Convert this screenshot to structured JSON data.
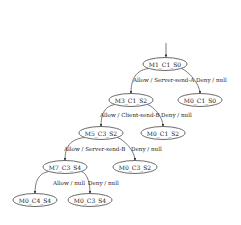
{
  "diagram": {
    "type": "state-machine-tree",
    "start": {
      "x": 166,
      "y1": 43,
      "y2": 57
    },
    "nodes": [
      {
        "id": "n0",
        "label": "M1_C1_S0",
        "x": 165,
        "y": 64
      },
      {
        "id": "n1",
        "label": "M3_C1_S2",
        "x": 131,
        "y": 100
      },
      {
        "id": "n2",
        "label": "M0_C1_S0",
        "x": 200,
        "y": 100
      },
      {
        "id": "n3",
        "label": "M5_C3_S2",
        "x": 101,
        "y": 133
      },
      {
        "id": "n4",
        "label": "M0_C1_S2",
        "x": 163,
        "y": 133
      },
      {
        "id": "n5",
        "label": "M7_C3_S4",
        "x": 65,
        "y": 167
      },
      {
        "id": "n6",
        "label": "M0_C3_S2",
        "x": 135,
        "y": 167
      },
      {
        "id": "n7",
        "label": "M0_C4_S4",
        "x": 35,
        "y": 200
      },
      {
        "id": "n8",
        "label": "M0_C3_S4",
        "x": 90,
        "y": 200
      }
    ],
    "edges": [
      {
        "from": "n0",
        "to": "n1",
        "label": "Allow / Server-send-A",
        "lx": 133,
        "ly": 82
      },
      {
        "from": "n0",
        "to": "n2",
        "label": "Deny / null",
        "lx": 196,
        "ly": 82
      },
      {
        "from": "n1",
        "to": "n3",
        "label": "Allow / Client-send-B",
        "lx": 100,
        "ly": 117
      },
      {
        "from": "n1",
        "to": "n4",
        "label": "Deny / null",
        "lx": 161,
        "ly": 117
      },
      {
        "from": "n3",
        "to": "n5",
        "label": "Allow / Server-send-B",
        "lx": 64,
        "ly": 151
      },
      {
        "from": "n3",
        "to": "n6",
        "label": "Deny / null",
        "lx": 131,
        "ly": 151
      },
      {
        "from": "n5",
        "to": "n7",
        "label": "Allow / null",
        "lx": 53,
        "ly": 185
      },
      {
        "from": "n5",
        "to": "n8",
        "label": "Deny / null",
        "lx": 88,
        "ly": 185
      }
    ]
  },
  "colors": {
    "stroke": "#444444",
    "text": "#222222",
    "background": "#ffffff"
  }
}
